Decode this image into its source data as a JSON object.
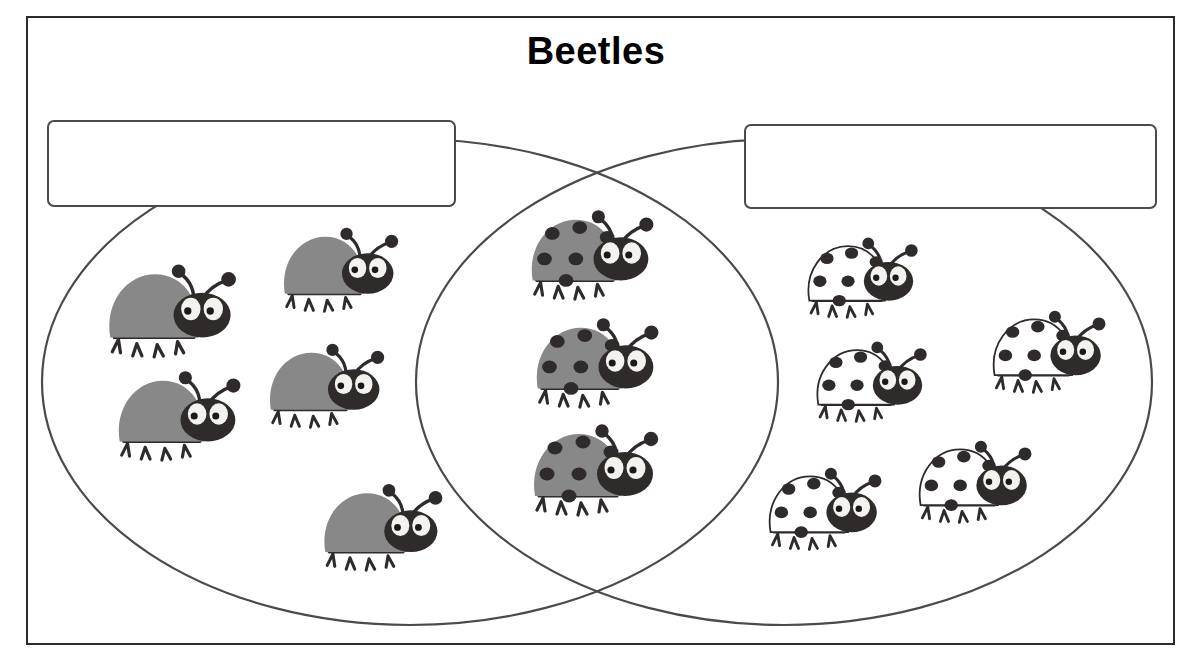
{
  "page": {
    "title": "Beetles",
    "background_color": "#ffffff",
    "frame_color": "#2b2b2b"
  },
  "venn": {
    "outline_color": "#4a4a4a",
    "left_circle": {
      "cx": 410,
      "cy": 382,
      "rx": 368,
      "ry": 243
    },
    "right_circle": {
      "cx": 784,
      "cy": 382,
      "rx": 368,
      "ry": 243
    },
    "left_label_box": {
      "text": "",
      "placeholder": ""
    },
    "right_label_box": {
      "text": "",
      "placeholder": ""
    }
  },
  "colors": {
    "beetle_gray_body": "#888888",
    "beetle_white_body": "#ffffff",
    "beetle_dark": "#2f2b2b",
    "beetle_spot": "#2f2b2b",
    "eye_white": "#f4f2ec",
    "pupil": "#1a1a1a"
  },
  "chart_data": {
    "type": "venn",
    "title": "Beetles",
    "sets": [
      {
        "name": "left",
        "label": "",
        "count": 5,
        "item_type": "gray beetle without spots"
      },
      {
        "name": "right",
        "label": "",
        "count": 5,
        "item_type": "white beetle with spots"
      }
    ],
    "intersection": {
      "count": 3,
      "item_type": "gray beetle with spots"
    },
    "total_items": 13,
    "legend_position": "none",
    "grid": false
  },
  "beetles": {
    "left_only": [
      {
        "id": "left-1",
        "x": 96,
        "y": 258,
        "spots": false,
        "body": "gray",
        "scale": 1.02
      },
      {
        "id": "left-2",
        "x": 272,
        "y": 222,
        "spots": false,
        "body": "gray",
        "scale": 0.92
      },
      {
        "id": "left-3",
        "x": 106,
        "y": 365,
        "spots": false,
        "body": "gray",
        "scale": 0.98
      },
      {
        "id": "left-4",
        "x": 258,
        "y": 338,
        "spots": false,
        "body": "gray",
        "scale": 0.92
      },
      {
        "id": "left-5",
        "x": 312,
        "y": 478,
        "spots": false,
        "body": "gray",
        "scale": 0.95
      }
    ],
    "intersection": [
      {
        "id": "mid-1",
        "x": 519,
        "y": 204,
        "spots": true,
        "body": "gray",
        "scale": 0.98
      },
      {
        "id": "mid-2",
        "x": 524,
        "y": 312,
        "spots": true,
        "body": "gray",
        "scale": 0.98
      },
      {
        "id": "mid-3",
        "x": 521,
        "y": 418,
        "spots": true,
        "body": "gray",
        "scale": 1.0
      }
    ],
    "right_only": [
      {
        "id": "right-1",
        "x": 797,
        "y": 232,
        "spots": true,
        "body": "white",
        "scale": 0.88
      },
      {
        "id": "right-2",
        "x": 806,
        "y": 336,
        "spots": true,
        "body": "white",
        "scale": 0.88
      },
      {
        "id": "right-3",
        "x": 982,
        "y": 305,
        "spots": true,
        "body": "white",
        "scale": 0.9
      },
      {
        "id": "right-4",
        "x": 758,
        "y": 462,
        "spots": true,
        "body": "white",
        "scale": 0.9
      },
      {
        "id": "right-5",
        "x": 908,
        "y": 435,
        "spots": true,
        "body": "white",
        "scale": 0.9
      }
    ]
  },
  "icons": {
    "beetle": "beetle-icon",
    "venn_left": "venn-left-circle-icon",
    "venn_right": "venn-right-circle-icon"
  }
}
